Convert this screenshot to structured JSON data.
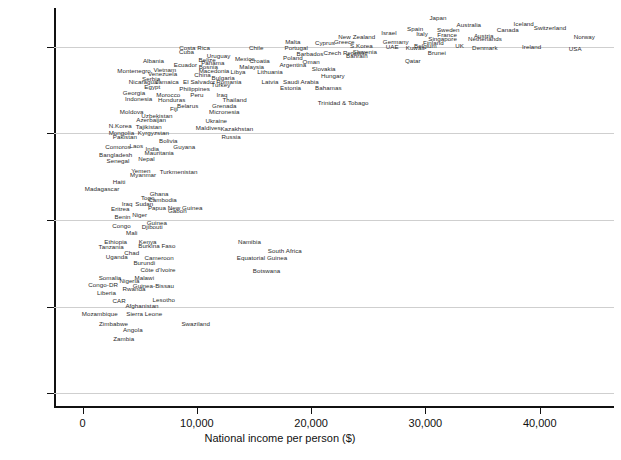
{
  "chart_data": {
    "type": "scatter",
    "title": "",
    "xlabel": "National income per person ($)",
    "ylabel": "Life expectancy, years",
    "xlim": [
      -2500,
      46500
    ],
    "ylim": [
      38.5,
      84.5
    ],
    "xticks": [
      0,
      10000,
      20000,
      30000,
      40000
    ],
    "xticklabels": [
      "0",
      "10,000",
      "20,000",
      "30,000",
      "40,000"
    ],
    "yticks": [
      40,
      50,
      60,
      70,
      80
    ],
    "yticklabels": [
      "40",
      "50",
      "60",
      "70",
      "80"
    ],
    "grid": "horizontal",
    "legend": "none",
    "label_mode": "text-labels-only",
    "points": [
      {
        "label": "Japan",
        "x": 31100,
        "y": 83.4
      },
      {
        "label": "Australia",
        "x": 33800,
        "y": 82.5
      },
      {
        "label": "Iceland",
        "x": 38600,
        "y": 82.6
      },
      {
        "label": "Switzerland",
        "x": 40900,
        "y": 82.2
      },
      {
        "label": "Canada",
        "x": 37200,
        "y": 82.0
      },
      {
        "label": "Spain",
        "x": 29100,
        "y": 82.1
      },
      {
        "label": "Sweden",
        "x": 32000,
        "y": 82.0
      },
      {
        "label": "Israel",
        "x": 26800,
        "y": 81.6
      },
      {
        "label": "Italy",
        "x": 29700,
        "y": 81.5
      },
      {
        "label": "France",
        "x": 31900,
        "y": 81.4
      },
      {
        "label": "Austria",
        "x": 35100,
        "y": 81.3
      },
      {
        "label": "Norway",
        "x": 43900,
        "y": 81.2
      },
      {
        "label": "New Zealand",
        "x": 24000,
        "y": 81.1
      },
      {
        "label": "Singapore",
        "x": 31500,
        "y": 80.9
      },
      {
        "label": "Netherlands",
        "x": 35200,
        "y": 80.9
      },
      {
        "label": "Greece",
        "x": 22900,
        "y": 80.6
      },
      {
        "label": "Germany",
        "x": 27400,
        "y": 80.6
      },
      {
        "label": "Finland",
        "x": 30700,
        "y": 80.5
      },
      {
        "label": "Cyprus",
        "x": 21200,
        "y": 80.5
      },
      {
        "label": "Malta",
        "x": 18400,
        "y": 80.6
      },
      {
        "label": "Belgium",
        "x": 30000,
        "y": 80.1
      },
      {
        "label": "UK",
        "x": 33000,
        "y": 80.1
      },
      {
        "label": "Denmark",
        "x": 35200,
        "y": 79.9
      },
      {
        "label": "Ireland",
        "x": 39300,
        "y": 80.0
      },
      {
        "label": "USA",
        "x": 43100,
        "y": 79.8
      },
      {
        "label": "UAE",
        "x": 27100,
        "y": 80.0
      },
      {
        "label": "Kuwait",
        "x": 29100,
        "y": 79.9
      },
      {
        "label": "S.Korea",
        "x": 24400,
        "y": 80.1
      },
      {
        "label": "Portugal",
        "x": 18700,
        "y": 79.9
      },
      {
        "label": "Brunei",
        "x": 31000,
        "y": 79.3
      },
      {
        "label": "Slovenia",
        "x": 24700,
        "y": 79.4
      },
      {
        "label": "Czech Republic",
        "x": 23000,
        "y": 79.3
      },
      {
        "label": "Barbados",
        "x": 19900,
        "y": 79.2
      },
      {
        "label": "Bahrain",
        "x": 24000,
        "y": 78.9
      },
      {
        "label": "Qatar",
        "x": 28900,
        "y": 78.4
      },
      {
        "label": "Costa Rica",
        "x": 9800,
        "y": 79.9
      },
      {
        "label": "Chile",
        "x": 15200,
        "y": 79.9
      },
      {
        "label": "Cuba",
        "x": 9100,
        "y": 79.4
      },
      {
        "label": "Uruguay",
        "x": 11900,
        "y": 79.0
      },
      {
        "label": "Mexico",
        "x": 14200,
        "y": 78.6
      },
      {
        "label": "Poland",
        "x": 18400,
        "y": 78.7
      },
      {
        "label": "Belize",
        "x": 10900,
        "y": 78.5
      },
      {
        "label": "Croatia",
        "x": 15500,
        "y": 78.4
      },
      {
        "label": "Oman",
        "x": 20000,
        "y": 78.3
      },
      {
        "label": "Panama",
        "x": 11400,
        "y": 78.2
      },
      {
        "label": "Albania",
        "x": 6200,
        "y": 78.4
      },
      {
        "label": "Argentina",
        "x": 18400,
        "y": 77.9
      },
      {
        "label": "Ecuador",
        "x": 9000,
        "y": 77.9
      },
      {
        "label": "Bosnia",
        "x": 11000,
        "y": 77.7
      },
      {
        "label": "Malaysia",
        "x": 14800,
        "y": 77.7
      },
      {
        "label": "Slovakia",
        "x": 21100,
        "y": 77.5
      },
      {
        "label": "Macedonia",
        "x": 11500,
        "y": 77.2
      },
      {
        "label": "Vietnam",
        "x": 7200,
        "y": 77.3
      },
      {
        "label": "Libya",
        "x": 13600,
        "y": 77.1
      },
      {
        "label": "Lithuania",
        "x": 16400,
        "y": 77.1
      },
      {
        "label": "Montenegro",
        "x": 4500,
        "y": 77.2
      },
      {
        "label": "Venezuela",
        "x": 7000,
        "y": 76.9
      },
      {
        "label": "China",
        "x": 10500,
        "y": 76.8
      },
      {
        "label": "Hungary",
        "x": 21900,
        "y": 76.6
      },
      {
        "label": "Bulgaria",
        "x": 12300,
        "y": 76.4
      },
      {
        "label": "Serbia",
        "x": 6000,
        "y": 76.3
      },
      {
        "label": "Jamaica",
        "x": 7400,
        "y": 76.0
      },
      {
        "label": "Romania",
        "x": 12800,
        "y": 76.0
      },
      {
        "label": "Saudi Arabia",
        "x": 19100,
        "y": 76.0
      },
      {
        "label": "Latvia",
        "x": 16400,
        "y": 76.0
      },
      {
        "label": "El Salvador",
        "x": 10200,
        "y": 76.0
      },
      {
        "label": "Nicaragua",
        "x": 5300,
        "y": 75.9
      },
      {
        "label": "Turkey",
        "x": 12100,
        "y": 75.6
      },
      {
        "label": "Egypt",
        "x": 6100,
        "y": 75.4
      },
      {
        "label": "Estonia",
        "x": 18200,
        "y": 75.3
      },
      {
        "label": "Bahamas",
        "x": 21500,
        "y": 75.3
      },
      {
        "label": "Philippines",
        "x": 9800,
        "y": 75.1
      },
      {
        "label": "Georgia",
        "x": 4500,
        "y": 74.7
      },
      {
        "label": "Morocco",
        "x": 7500,
        "y": 74.5
      },
      {
        "label": "Peru",
        "x": 10000,
        "y": 74.4
      },
      {
        "label": "Iraq",
        "x": 12200,
        "y": 74.5
      },
      {
        "label": "Indonesia",
        "x": 4900,
        "y": 74.0
      },
      {
        "label": "Honduras",
        "x": 7800,
        "y": 73.9
      },
      {
        "label": "Thailand",
        "x": 13300,
        "y": 73.9
      },
      {
        "label": "Trinidad & Tobago",
        "x": 22800,
        "y": 73.5
      },
      {
        "label": "Belarus",
        "x": 9200,
        "y": 73.2
      },
      {
        "label": "Grenada",
        "x": 12400,
        "y": 73.2
      },
      {
        "label": "Fiji",
        "x": 8000,
        "y": 72.8
      },
      {
        "label": "Moldova",
        "x": 4300,
        "y": 72.5
      },
      {
        "label": "Micronesia",
        "x": 12400,
        "y": 72.5
      },
      {
        "label": "Uzbekistan",
        "x": 6500,
        "y": 72.0
      },
      {
        "label": "Azerbaijan",
        "x": 6000,
        "y": 71.5
      },
      {
        "label": "Ukraine",
        "x": 11700,
        "y": 71.4
      },
      {
        "label": "N.Korea",
        "x": 3300,
        "y": 70.9
      },
      {
        "label": "Tajikistan",
        "x": 5800,
        "y": 70.7
      },
      {
        "label": "Maldives",
        "x": 11000,
        "y": 70.6
      },
      {
        "label": "Kazakhstan",
        "x": 13500,
        "y": 70.5
      },
      {
        "label": "Mongolia",
        "x": 3400,
        "y": 70.1
      },
      {
        "label": "Kyrgyzstan",
        "x": 6200,
        "y": 70.0
      },
      {
        "label": "Pakistan",
        "x": 3700,
        "y": 69.6
      },
      {
        "label": "Russia",
        "x": 13000,
        "y": 69.6
      },
      {
        "label": "Bolivia",
        "x": 7500,
        "y": 69.1
      },
      {
        "label": "Laos",
        "x": 4700,
        "y": 68.5
      },
      {
        "label": "India",
        "x": 6100,
        "y": 68.2
      },
      {
        "label": "Guyana",
        "x": 8900,
        "y": 68.4
      },
      {
        "label": "Comoros",
        "x": 3100,
        "y": 68.4
      },
      {
        "label": "Mauritania",
        "x": 6700,
        "y": 67.7
      },
      {
        "label": "Bangladesh",
        "x": 2900,
        "y": 67.5
      },
      {
        "label": "Nepal",
        "x": 5600,
        "y": 67.1
      },
      {
        "label": "Senegal",
        "x": 3100,
        "y": 66.8
      },
      {
        "label": "Yemen",
        "x": 5100,
        "y": 65.7
      },
      {
        "label": "Turkmenistan",
        "x": 8400,
        "y": 65.6
      },
      {
        "label": "Myanmar",
        "x": 5300,
        "y": 65.2
      },
      {
        "label": "Haiti",
        "x": 3200,
        "y": 64.4
      },
      {
        "label": "Madagascar",
        "x": 1700,
        "y": 63.6
      },
      {
        "label": "Ghana",
        "x": 6700,
        "y": 63.0
      },
      {
        "label": "Togo",
        "x": 5700,
        "y": 62.5
      },
      {
        "label": "Cambodia",
        "x": 7000,
        "y": 62.3
      },
      {
        "label": "Iraq",
        "x": 3900,
        "y": 61.9
      },
      {
        "label": "Sudan",
        "x": 5400,
        "y": 61.9
      },
      {
        "label": "Papua New Guinea",
        "x": 8100,
        "y": 61.4
      },
      {
        "label": "Eritrea",
        "x": 3300,
        "y": 61.3
      },
      {
        "label": "Gabon",
        "x": 8300,
        "y": 61.0
      },
      {
        "label": "Niger",
        "x": 5000,
        "y": 60.6
      },
      {
        "label": "Benin",
        "x": 3500,
        "y": 60.4
      },
      {
        "label": "Guinea",
        "x": 6500,
        "y": 59.6
      },
      {
        "label": "Congo",
        "x": 3400,
        "y": 59.3
      },
      {
        "label": "Djibouti",
        "x": 6100,
        "y": 59.2
      },
      {
        "label": "Mali",
        "x": 4300,
        "y": 58.5
      },
      {
        "label": "Ethiopia",
        "x": 2900,
        "y": 57.4
      },
      {
        "label": "Kenya",
        "x": 5700,
        "y": 57.5
      },
      {
        "label": "Namibia",
        "x": 14600,
        "y": 57.4
      },
      {
        "label": "Burkina Faso",
        "x": 6500,
        "y": 57.0
      },
      {
        "label": "Tanzania",
        "x": 2500,
        "y": 56.9
      },
      {
        "label": "South Africa",
        "x": 17700,
        "y": 56.4
      },
      {
        "label": "Chad",
        "x": 4300,
        "y": 56.2
      },
      {
        "label": "Uganda",
        "x": 3000,
        "y": 55.7
      },
      {
        "label": "Cameroon",
        "x": 6700,
        "y": 55.6
      },
      {
        "label": "Equatorial Guinea",
        "x": 15700,
        "y": 55.6
      },
      {
        "label": "Burundi",
        "x": 5400,
        "y": 55.0
      },
      {
        "label": "Côte d'Ivoire",
        "x": 6600,
        "y": 54.2
      },
      {
        "label": "Botswana",
        "x": 16100,
        "y": 54.1
      },
      {
        "label": "Somalia",
        "x": 2400,
        "y": 53.3
      },
      {
        "label": "Malawi",
        "x": 5400,
        "y": 53.3
      },
      {
        "label": "Nigeria",
        "x": 4100,
        "y": 52.9
      },
      {
        "label": "Congo-DR",
        "x": 1800,
        "y": 52.5
      },
      {
        "label": "Guinea-Bissau",
        "x": 6200,
        "y": 52.4
      },
      {
        "label": "Rwanda",
        "x": 4500,
        "y": 52.0
      },
      {
        "label": "Liberia",
        "x": 2100,
        "y": 51.6
      },
      {
        "label": "CAR",
        "x": 3200,
        "y": 50.6
      },
      {
        "label": "Lesotho",
        "x": 7100,
        "y": 50.7
      },
      {
        "label": "Afghanistan",
        "x": 5200,
        "y": 50.1
      },
      {
        "label": "Mozambique",
        "x": 1500,
        "y": 49.1
      },
      {
        "label": "Sierra Leone",
        "x": 5400,
        "y": 49.1
      },
      {
        "label": "Zimbabwe",
        "x": 2700,
        "y": 48.0
      },
      {
        "label": "Swaziland",
        "x": 9900,
        "y": 48.0
      },
      {
        "label": "Angola",
        "x": 4400,
        "y": 47.3
      },
      {
        "label": "Zambia",
        "x": 3600,
        "y": 46.3
      }
    ]
  }
}
